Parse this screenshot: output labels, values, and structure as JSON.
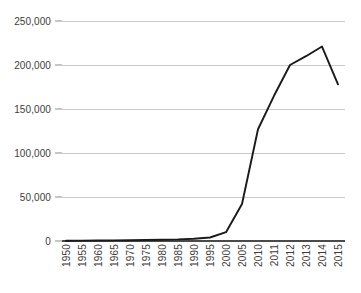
{
  "chart_data": {
    "type": "line",
    "title": "",
    "subtitle": "",
    "xlabel": "",
    "ylabel": "",
    "categories": [
      "1950",
      "1955",
      "1960",
      "1965",
      "1970",
      "1975",
      "1980",
      "1985",
      "1990",
      "1995",
      "2000",
      "2005",
      "2010",
      "2011",
      "2012",
      "2013",
      "2014",
      "2015"
    ],
    "values": [
      300,
      400,
      500,
      700,
      900,
      1100,
      1400,
      1800,
      2600,
      4000,
      10000,
      42000,
      127000,
      165000,
      200000,
      210000,
      221000,
      178000
    ],
    "series": [
      {
        "name": "",
        "values": [
          300,
          400,
          500,
          700,
          900,
          1100,
          1400,
          1800,
          2600,
          4000,
          10000,
          42000,
          127000,
          165000,
          200000,
          210000,
          221000,
          178000
        ]
      }
    ],
    "ylim": [
      0,
      250000
    ],
    "y_ticks": [
      0,
      50000,
      100000,
      150000,
      200000,
      250000
    ],
    "y_tick_labels": [
      "0",
      "50,000",
      "100,000",
      "150,000",
      "200,000",
      "250,000"
    ],
    "grid": "horizontal",
    "legend": "none",
    "annotations": [],
    "colors": {
      "series_line": "#1a1a1a",
      "gridline": "#c9c9c9",
      "axis": "#4a4a4a",
      "tick_label": "#3d3d3d",
      "background": "#ffffff"
    }
  }
}
